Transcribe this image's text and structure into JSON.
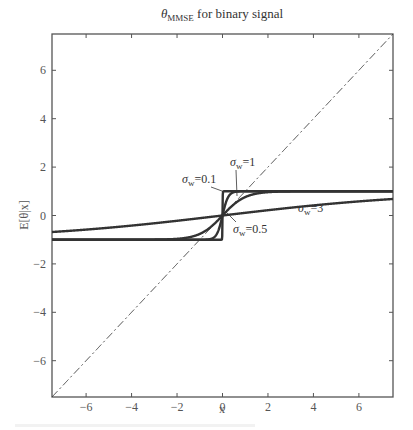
{
  "chart_data": {
    "type": "line",
    "title_parts": {
      "symbol": "θ",
      "subscript": "MMSE",
      "rest": " for binary signal"
    },
    "xlabel": "x",
    "ylabel": "E[θ|x]",
    "xlim": [
      -7.5,
      7.5
    ],
    "ylim": [
      -7.5,
      7.5
    ],
    "xticks": [
      -6,
      -4,
      -2,
      0,
      2,
      4,
      6
    ],
    "yticks": [
      -6,
      -4,
      -2,
      0,
      2,
      4,
      6
    ],
    "xtick_labels": [
      "−6",
      "−4",
      "−2",
      "0",
      "2",
      "4",
      "6"
    ],
    "ytick_labels": [
      "−6",
      "−4",
      "−2",
      "0",
      "2",
      "4",
      "6"
    ],
    "grid": false,
    "legend": "none (inline annotations)",
    "series": [
      {
        "name": "σw = 0.1",
        "function": "tanh(x/σw²)",
        "sigma": 0.1,
        "style": "solid"
      },
      {
        "name": "σw = 0.5",
        "function": "tanh(x/σw²)",
        "sigma": 0.5,
        "style": "solid"
      },
      {
        "name": "σw = 1",
        "function": "tanh(x/σw²)",
        "sigma": 1,
        "style": "solid"
      },
      {
        "name": "σw = 3",
        "function": "tanh(x/σw²)",
        "sigma": 3,
        "style": "solid"
      },
      {
        "name": "y = x",
        "function": "x",
        "style": "dash-dot"
      }
    ],
    "annotations": [
      {
        "text_sym": "σ",
        "sub": "w",
        "val": "=0.1"
      },
      {
        "text_sym": "σ",
        "sub": "w",
        "val": "=1"
      },
      {
        "text_sym": "σ",
        "sub": "w",
        "val": "=0.5"
      },
      {
        "text_sym": "σ",
        "sub": "w",
        "val": "=3"
      }
    ]
  },
  "colors": {
    "curve": "#333333",
    "axis": "#555555"
  }
}
